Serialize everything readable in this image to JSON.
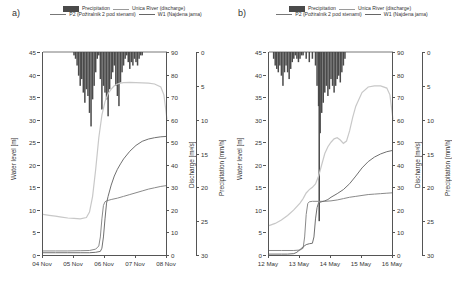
{
  "figure": {
    "panels": [
      {
        "label": "a)",
        "legend": {
          "precipitation": "Precipitation",
          "discharge": "Unica River (discharge)",
          "p2": "P2 (Požiralnik 2 pod stenami)",
          "w1": "W1 (Najdena jama)"
        },
        "axes": {
          "y_left_label": "Water level [m]",
          "y_left_ticks": [
            "0",
            "5",
            "10",
            "15",
            "20",
            "25",
            "30",
            "35",
            "40",
            "45"
          ],
          "y_disch_label": "Discharge [m³/s]",
          "y_disch_ticks": [
            "0",
            "10",
            "20",
            "30",
            "40",
            "50",
            "60",
            "70",
            "80",
            "90"
          ],
          "y_precip_label": "Precipitation [mm/h]",
          "y_precip_ticks": [
            "0",
            "5",
            "10",
            "15",
            "20",
            "25",
            "30"
          ],
          "x_ticks": [
            "04 Nov",
            "05 Nov",
            "06 Nov",
            "07 Nov",
            "08 Nov"
          ]
        }
      },
      {
        "label": "b)",
        "legend": {
          "precipitation": "Precipitation",
          "discharge": "Unica River (discharge)",
          "p2": "P2 (Požiralnik 2 pod stenami)",
          "w1": "W1 (Najdena jama)"
        },
        "axes": {
          "y_left_label": "Water level [m]",
          "y_left_ticks": [
            "0",
            "5",
            "10",
            "15",
            "20",
            "25",
            "30",
            "35",
            "40",
            "45"
          ],
          "y_disch_label": "Discharge [m³/s]",
          "y_disch_ticks": [
            "0",
            "10",
            "20",
            "30",
            "40",
            "50",
            "60",
            "70",
            "80",
            "90"
          ],
          "y_precip_label": "Precipitation [mm/h]",
          "y_precip_ticks": [
            "0",
            "5",
            "10",
            "15",
            "20",
            "25",
            "30"
          ],
          "x_ticks": [
            "12 May",
            "13 May",
            "14 May",
            "15 May",
            "16 May"
          ]
        }
      }
    ],
    "colors": {
      "precipitation": "#4a4a4a",
      "discharge": "#c8c8c8",
      "p2": "#8a8a8a",
      "w1": "#707070",
      "axis": "#555555",
      "text": "#333333"
    }
  },
  "chart_data": [
    {
      "type": "line",
      "title": "a) November event — Unica River discharge, cave water levels and precipitation",
      "xlabel": "",
      "ylabel": "Water level [m]",
      "y2label": "Discharge [m³/s]",
      "y3label": "Precipitation [mm/h]",
      "ylim": [
        0,
        45
      ],
      "y2lim": [
        0,
        90
      ],
      "y3lim": [
        30,
        0
      ],
      "xlim": [
        "04 Nov",
        "08 Nov"
      ],
      "x_tick_labels": [
        "04 Nov",
        "05 Nov",
        "06 Nov",
        "07 Nov",
        "08 Nov"
      ],
      "grid": false,
      "legend_position": "top",
      "series": [
        {
          "name": "Unica River (discharge)",
          "axis": "y2",
          "unit": "m³/s",
          "x": [
            0.0,
            0.2,
            0.4,
            0.6,
            0.8,
            1.0,
            1.2,
            1.4,
            1.5,
            1.6,
            1.7,
            1.8,
            1.9,
            2.0,
            2.1,
            2.2,
            2.3,
            2.4,
            2.5,
            2.6,
            2.8,
            3.0,
            3.2,
            3.4,
            3.6,
            3.8,
            3.9,
            4.0
          ],
          "values": [
            18.0,
            17.6,
            17.2,
            16.8,
            16.4,
            16.2,
            16.0,
            16.6,
            19.0,
            26.0,
            38.0,
            52.0,
            62.0,
            68.0,
            71.5,
            73.5,
            75.0,
            75.8,
            76.2,
            76.4,
            76.5,
            76.4,
            76.3,
            76.2,
            75.8,
            74.5,
            71.0,
            60.0
          ]
        },
        {
          "name": "P2 (Požiralnik 2 pod stenami)",
          "axis": "y1",
          "unit": "m",
          "x": [
            0.0,
            0.4,
            0.8,
            1.2,
            1.5,
            1.7,
            1.8,
            1.85,
            1.9,
            1.95,
            2.0,
            2.05,
            2.1,
            2.2,
            2.4,
            2.6,
            2.8,
            3.0,
            3.2,
            3.4,
            3.6,
            3.8,
            4.0
          ],
          "values": [
            0.9,
            0.9,
            0.9,
            0.95,
            1.0,
            1.3,
            2.0,
            4.0,
            8.0,
            11.0,
            11.8,
            12.0,
            12.1,
            12.3,
            12.6,
            13.0,
            13.4,
            13.8,
            14.2,
            14.6,
            14.9,
            15.2,
            15.4
          ]
        },
        {
          "name": "W1 (Najdena jama)",
          "axis": "y1",
          "unit": "m",
          "x": [
            0.0,
            0.4,
            0.8,
            1.2,
            1.5,
            1.7,
            1.85,
            1.9,
            1.95,
            2.0,
            2.05,
            2.1,
            2.2,
            2.3,
            2.4,
            2.5,
            2.6,
            2.8,
            3.0,
            3.2,
            3.4,
            3.6,
            3.8,
            4.0
          ],
          "values": [
            0.5,
            0.5,
            0.5,
            0.5,
            0.5,
            0.6,
            0.8,
            1.5,
            4.0,
            8.0,
            11.5,
            13.0,
            15.5,
            17.5,
            19.0,
            20.2,
            21.3,
            23.0,
            24.3,
            25.2,
            25.7,
            26.0,
            26.2,
            26.3
          ]
        }
      ],
      "precipitation_bars": {
        "name": "Precipitation",
        "axis": "y3",
        "unit": "mm/h",
        "note": "plotted downward from top of plot area",
        "x": [
          1.0,
          1.05,
          1.1,
          1.15,
          1.2,
          1.25,
          1.3,
          1.35,
          1.4,
          1.45,
          1.5,
          1.55,
          1.6,
          1.65,
          1.7,
          1.75,
          1.8,
          1.85,
          1.9,
          1.95,
          2.0,
          2.05,
          2.1,
          2.15,
          2.2,
          2.25,
          2.3,
          2.35,
          2.4,
          2.45,
          2.5,
          2.55,
          2.6,
          2.65,
          2.7,
          2.75,
          2.8,
          2.85,
          2.9,
          2.95,
          3.0,
          3.05,
          3.1,
          3.15,
          3.2
        ],
        "values": [
          0.5,
          1.0,
          2.0,
          3.5,
          5.0,
          4.0,
          6.0,
          7.5,
          5.5,
          6.5,
          9.0,
          11.0,
          7.0,
          5.0,
          3.0,
          1.0,
          0.5,
          4.0,
          8.5,
          5.0,
          6.0,
          7.0,
          9.5,
          5.5,
          4.0,
          3.0,
          2.0,
          5.0,
          6.5,
          8.0,
          4.5,
          3.0,
          2.0,
          1.0,
          0.5,
          1.5,
          2.5,
          1.5,
          2.0,
          1.0,
          1.5,
          2.0,
          1.0,
          0.5,
          0.5
        ]
      }
    },
    {
      "type": "line",
      "title": "b) May event — Unica River discharge, cave water levels and precipitation",
      "xlabel": "",
      "ylabel": "Water level [m]",
      "y2label": "Discharge [m³/s]",
      "y3label": "Precipitation [mm/h]",
      "ylim": [
        0,
        45
      ],
      "y2lim": [
        0,
        90
      ],
      "y3lim": [
        30,
        0
      ],
      "xlim": [
        "12 May",
        "16 May"
      ],
      "x_tick_labels": [
        "12 May",
        "13 May",
        "14 May",
        "15 May",
        "16 May"
      ],
      "grid": false,
      "legend_position": "top",
      "series": [
        {
          "name": "Unica River (discharge)",
          "axis": "y2",
          "unit": "m³/s",
          "x": [
            0.0,
            0.2,
            0.4,
            0.6,
            0.8,
            1.0,
            1.1,
            1.2,
            1.3,
            1.4,
            1.5,
            1.6,
            1.7,
            1.8,
            1.9,
            2.0,
            2.1,
            2.2,
            2.3,
            2.4,
            2.5,
            2.6,
            2.7,
            2.8,
            3.0,
            3.2,
            3.4,
            3.6,
            3.8,
            3.9,
            4.0
          ],
          "values": [
            13.0,
            14.0,
            15.5,
            17.5,
            20.0,
            23.0,
            25.0,
            27.5,
            29.0,
            30.0,
            31.5,
            35.0,
            40.0,
            45.0,
            48.0,
            50.0,
            51.5,
            52.0,
            51.0,
            49.5,
            50.5,
            55.0,
            61.0,
            66.0,
            72.0,
            74.5,
            75.0,
            75.0,
            74.0,
            71.0,
            60.0
          ]
        },
        {
          "name": "P2 (Požiralnik 2 pod stenami)",
          "axis": "y1",
          "unit": "m",
          "x": [
            0.0,
            0.4,
            0.8,
            1.0,
            1.1,
            1.15,
            1.2,
            1.25,
            1.3,
            1.4,
            1.6,
            1.8,
            2.0,
            2.2,
            2.4,
            2.6,
            2.8,
            3.0,
            3.2,
            3.4,
            3.6,
            3.8,
            4.0
          ],
          "values": [
            1.0,
            1.0,
            1.0,
            1.1,
            1.5,
            4.0,
            9.0,
            11.4,
            11.8,
            11.9,
            11.9,
            11.9,
            12.0,
            12.2,
            12.5,
            12.8,
            13.0,
            13.2,
            13.4,
            13.5,
            13.6,
            13.7,
            13.8
          ]
        },
        {
          "name": "W1 (Najdena jama)",
          "axis": "y1",
          "unit": "m",
          "x": [
            0.0,
            0.4,
            0.6,
            0.8,
            0.9,
            1.0,
            1.1,
            1.2,
            1.3,
            1.4,
            1.45,
            1.5,
            1.55,
            1.6,
            1.7,
            1.8,
            1.9,
            2.0,
            2.2,
            2.4,
            2.6,
            2.8,
            3.0,
            3.2,
            3.4,
            3.6,
            3.8,
            4.0
          ],
          "values": [
            0.2,
            0.2,
            0.2,
            0.3,
            0.6,
            1.2,
            1.8,
            2.3,
            2.5,
            2.6,
            4.0,
            8.0,
            10.5,
            11.6,
            11.8,
            12.0,
            12.3,
            12.8,
            13.6,
            14.5,
            15.8,
            17.5,
            19.3,
            20.7,
            21.7,
            22.4,
            22.9,
            23.2
          ]
        }
      ],
      "precipitation_bars": {
        "name": "Precipitation",
        "axis": "y3",
        "unit": "mm/h",
        "note": "plotted downward from top of plot area; major spike near 14 May",
        "x": [
          0.15,
          0.2,
          0.25,
          0.3,
          0.35,
          0.4,
          0.45,
          0.5,
          0.55,
          0.6,
          0.65,
          0.7,
          0.75,
          0.8,
          0.85,
          0.9,
          0.95,
          1.0,
          1.05,
          1.1,
          1.2,
          1.3,
          1.4,
          1.5,
          1.55,
          1.6,
          1.62,
          1.65,
          1.7,
          1.75,
          1.8,
          1.85,
          1.9,
          1.95,
          2.0,
          2.05,
          2.1,
          2.15,
          2.2,
          2.25,
          2.3,
          2.35,
          2.4,
          2.45
        ],
        "values": [
          1.0,
          2.0,
          2.5,
          3.0,
          2.0,
          3.5,
          5.0,
          3.0,
          2.0,
          3.0,
          4.0,
          2.5,
          1.5,
          1.0,
          0.5,
          1.0,
          1.5,
          1.0,
          0.5,
          0.5,
          1.0,
          1.5,
          1.0,
          2.0,
          5.0,
          8.0,
          25.0,
          12.0,
          9.0,
          7.5,
          6.0,
          5.0,
          6.5,
          5.5,
          4.0,
          5.0,
          6.0,
          5.0,
          4.0,
          3.5,
          4.5,
          3.0,
          2.0,
          1.0
        ]
      }
    }
  ]
}
